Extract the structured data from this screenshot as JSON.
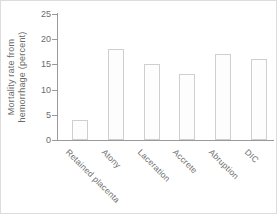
{
  "figure": {
    "background": "#ffffff",
    "border_color": "#dcdcdc"
  },
  "chart_data": {
    "type": "bar",
    "categories": [
      "Retained placenta",
      "Atony",
      "Laceration",
      "Accrete",
      "Abruption",
      "DIC"
    ],
    "values": [
      4,
      18,
      15,
      13,
      17,
      16
    ],
    "title": "",
    "xlabel": "",
    "ylabel": "Mortality rate from hemorrhage (percent)",
    "ylabel_lines": [
      "Mortality rate from",
      "hemorrhage (percent)"
    ],
    "ylim": [
      0,
      25
    ],
    "yticks": [
      0,
      5,
      10,
      15,
      20,
      25
    ],
    "grid": false,
    "legend": false,
    "bar_fill": "#fdfdfd",
    "bar_border": "#cfcfcf",
    "axis_color": "#9a9a9a",
    "text_color": "#6b6b6b"
  }
}
